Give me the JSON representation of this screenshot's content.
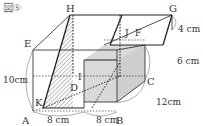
{
  "figure": {
    "title": "図⑤",
    "vertices": {
      "A": "A",
      "B": "B",
      "C": "C",
      "D": "D",
      "E": "E",
      "F": "F",
      "G": "G",
      "H": "H",
      "I": "I",
      "J": "J",
      "K": "K"
    },
    "dimensions": {
      "AB_left": "8 cm",
      "AB_right": "8 cm",
      "BC": "12cm",
      "height_lower": "6 cm",
      "height_upper": "4 cm",
      "AE": "10cm"
    },
    "colors": {
      "line": "#222222",
      "shaded_face": "#d9d9d9",
      "hatch": "#444444",
      "dim_arc": "#777777"
    }
  }
}
